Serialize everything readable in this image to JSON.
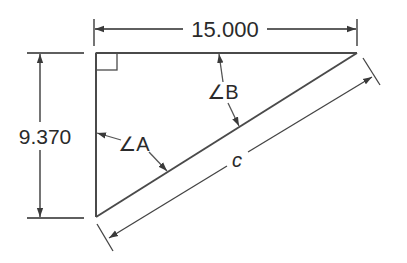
{
  "diagram": {
    "type": "right-triangle-dimensioned",
    "dimensions": {
      "horizontal_leg": "15.000",
      "vertical_leg": "9.370",
      "hypotenuse": "c"
    },
    "angles": {
      "angle_a": "∠A",
      "angle_b": "∠B"
    },
    "colors": {
      "line": "#3a3a3a",
      "text": "#2a2a2a",
      "background": "#ffffff"
    }
  }
}
